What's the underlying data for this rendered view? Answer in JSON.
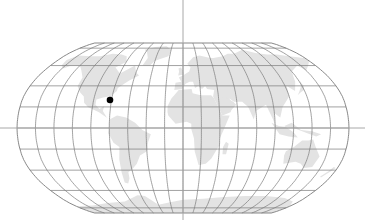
{
  "map": {
    "projection": "Robinson",
    "view": "world",
    "width": 365,
    "height": 220,
    "center_x": 183,
    "center_y": 128,
    "half_width": 166,
    "half_height": 85,
    "colors": {
      "background": "#ffffff",
      "land": "#e3e3e3",
      "graticule": "#7a7a7a",
      "crosshair": "#a8a8a8",
      "marker": "#000000"
    },
    "graticule": {
      "meridian_step_deg": 20,
      "parallel_step_deg": 20
    },
    "crosshair": {
      "vertical_x": 183,
      "horizontal_y": 128
    },
    "markers": [
      {
        "name": "location-marker",
        "x": 110,
        "y": 100,
        "radius": 3.3,
        "approx_region": "Gulf of Mexico / Florida"
      }
    ]
  }
}
